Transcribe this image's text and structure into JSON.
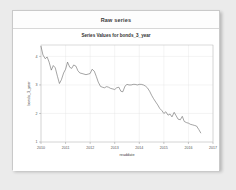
{
  "card": {
    "header_title": "Raw series"
  },
  "chart_data": {
    "type": "line",
    "title": "Series Values for bonds_3_year",
    "xlabel": "readdate",
    "ylabel": "bonds_3_year",
    "grid": true,
    "legend": "none",
    "xlim": [
      2010.0,
      2017.0
    ],
    "ylim": [
      1.0,
      4.4
    ],
    "xticks": [
      "2010",
      "2011",
      "2012",
      "2013",
      "2014",
      "2015",
      "2016",
      "2017"
    ],
    "xtick_values": [
      2010,
      2011,
      2012,
      2013,
      2014,
      2015,
      2016,
      2017
    ],
    "yticks": [
      "4",
      "3",
      "2",
      "1"
    ],
    "ytick_values": [
      4,
      3,
      2,
      1
    ],
    "series": [
      {
        "name": "bonds_3_year",
        "color": "#5a5a5a",
        "x": [
          2010.0,
          2010.08,
          2010.17,
          2010.25,
          2010.33,
          2010.42,
          2010.5,
          2010.58,
          2010.67,
          2010.75,
          2010.83,
          2010.92,
          2011.0,
          2011.08,
          2011.17,
          2011.25,
          2011.33,
          2011.42,
          2011.5,
          2011.58,
          2011.67,
          2011.75,
          2011.83,
          2011.92,
          2012.0,
          2012.08,
          2012.17,
          2012.25,
          2012.33,
          2012.42,
          2012.5,
          2012.58,
          2012.67,
          2012.75,
          2012.83,
          2012.92,
          2013.0,
          2013.08,
          2013.17,
          2013.25,
          2013.33,
          2013.42,
          2013.5,
          2013.58,
          2013.67,
          2013.75,
          2013.83,
          2013.92,
          2014.0,
          2014.08,
          2014.17,
          2014.25,
          2014.33,
          2014.42,
          2014.5,
          2014.58,
          2014.67,
          2014.75,
          2014.83,
          2014.92,
          2015.0,
          2015.08,
          2015.17,
          2015.25,
          2015.33,
          2015.42,
          2015.5,
          2015.58,
          2015.67,
          2015.75,
          2015.83,
          2015.92,
          2016.0,
          2016.08,
          2016.17,
          2016.25,
          2016.33,
          2016.42,
          2016.5
        ],
        "values": [
          4.35,
          4.05,
          3.92,
          3.98,
          3.8,
          3.52,
          3.68,
          3.6,
          3.3,
          3.05,
          3.18,
          3.42,
          3.55,
          3.8,
          3.62,
          3.58,
          3.7,
          3.66,
          3.5,
          3.42,
          3.4,
          3.38,
          3.36,
          3.38,
          3.4,
          3.55,
          3.48,
          3.3,
          3.1,
          2.95,
          2.92,
          2.9,
          2.94,
          2.92,
          2.88,
          2.86,
          2.84,
          2.9,
          2.92,
          2.78,
          2.76,
          2.96,
          3.02,
          3.0,
          3.0,
          3.02,
          3.02,
          3.0,
          3.02,
          3.02,
          3.0,
          2.96,
          2.9,
          2.78,
          2.64,
          2.52,
          2.4,
          2.3,
          2.18,
          2.1,
          2.0,
          2.06,
          1.94,
          1.98,
          1.88,
          2.04,
          1.92,
          1.8,
          1.78,
          1.9,
          1.72,
          1.68,
          1.66,
          1.62,
          1.6,
          1.58,
          1.56,
          1.44,
          1.32
        ]
      }
    ]
  }
}
